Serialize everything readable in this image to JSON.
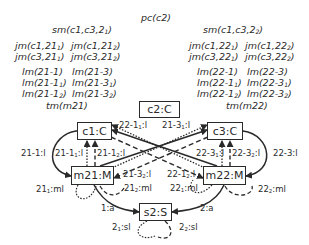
{
  "diagram": {
    "header": {
      "pc": "pc(c2)"
    },
    "left_column": {
      "sm": [
        "sm(c1,c3,2",
        "1",
        ")"
      ],
      "jm": [
        [
          "jm(c1,21",
          "1",
          ")"
        ],
        [
          "jm(c1,21",
          "2",
          ")"
        ],
        [
          "jm(c3,21",
          "1",
          ")"
        ],
        [
          "jm(c3,21",
          "2",
          ")"
        ]
      ],
      "lm": [
        [
          "lm(21-1)",
          "",
          ""
        ],
        [
          "lm(21-3)",
          "",
          ""
        ],
        [
          "lm(21-1",
          "1",
          ")"
        ],
        [
          "lm(21-3",
          "1",
          ")"
        ],
        [
          "lm(21-1",
          "2",
          ")"
        ],
        [
          "lm(21-3",
          "2",
          ")"
        ]
      ],
      "tm": "tm(m21)"
    },
    "right_column": {
      "sm": [
        "sm(c1,c3,2",
        "2",
        ")"
      ],
      "jm": [
        [
          "jm(c1,22",
          "1",
          ")"
        ],
        [
          "jm(c1,22",
          "2",
          ")"
        ],
        [
          "jm(c3,22",
          "1",
          ")"
        ],
        [
          "jm(c3,22",
          "2",
          ")"
        ]
      ],
      "lm": [
        [
          "lm(22-1)",
          "",
          ""
        ],
        [
          "lm(22-3)",
          "",
          ""
        ],
        [
          "lm(22-1",
          "1",
          ")"
        ],
        [
          "lm(22-3",
          "1",
          ")"
        ],
        [
          "lm(22-1",
          "2",
          ")"
        ],
        [
          "lm(22-3",
          "2",
          ")"
        ]
      ],
      "tm": "tm(m22)"
    },
    "nodes": {
      "c2": "c2:C",
      "c1": "c1:C",
      "c3": "c3:C",
      "m21": "m21:M",
      "m22": "m22:M",
      "s2": "s2:S"
    },
    "edge_labels": {
      "e_21_1": [
        "21-1:l",
        "",
        ""
      ],
      "e_21_1_1": [
        "21-1",
        "1",
        ":l"
      ],
      "e_21_1_2": [
        "21-1",
        "2",
        ":l"
      ],
      "e_22_1_1": [
        "22-1",
        "1",
        ":l"
      ],
      "e_21_3_1": [
        "21-3",
        "1",
        ":l"
      ],
      "e_22_3_1": [
        "22-3",
        "1",
        ":l"
      ],
      "e_22_3_2": [
        "22-3",
        "2",
        ":l"
      ],
      "e_22_3": [
        "22-3:l",
        "",
        ""
      ],
      "e_21_3_2": [
        "21-3",
        "2",
        ":l"
      ],
      "e_22_1_2": [
        "22-1",
        "2",
        ":l"
      ],
      "e_21_1_ml": [
        "21",
        "1",
        ":ml"
      ],
      "e_21_2_ml": [
        "21",
        "2",
        ":ml"
      ],
      "e_22_1_ml": [
        "22",
        "1",
        ":ml"
      ],
      "e_22_2_ml": [
        "22",
        "2",
        ":ml"
      ],
      "e_1a": [
        "1:a",
        "",
        ""
      ],
      "e_2a": [
        "2:a",
        "",
        ""
      ],
      "e_2_1_sl": [
        "2",
        "1",
        ":sl"
      ],
      "e_2_2_sl": [
        "2",
        "2",
        ":sl"
      ]
    }
  }
}
